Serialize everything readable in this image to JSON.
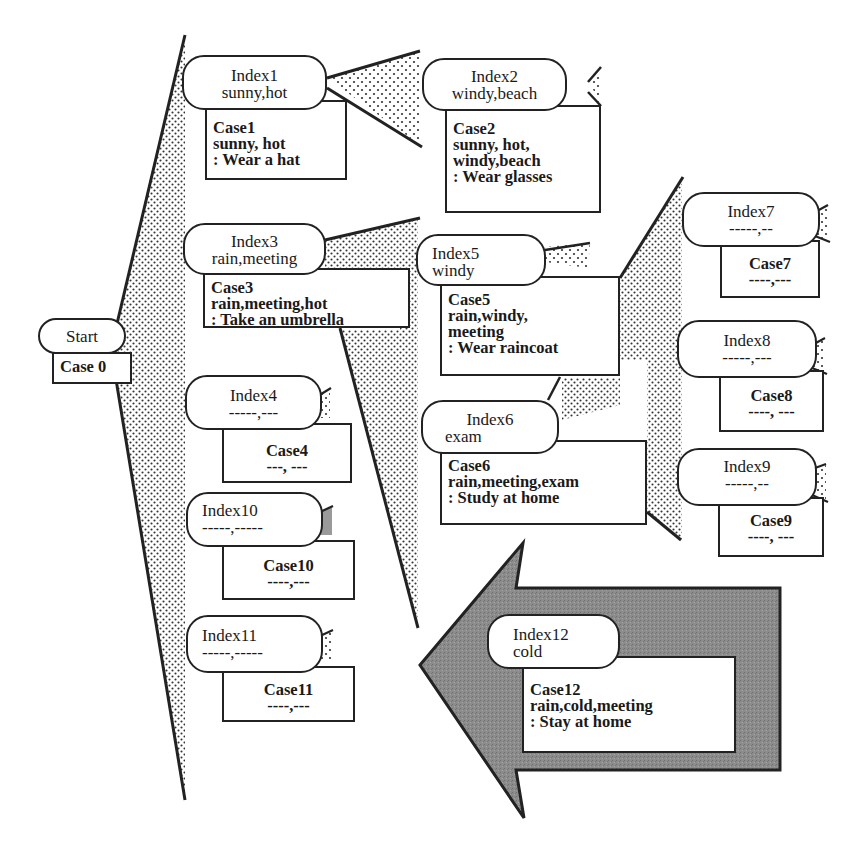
{
  "diagram": {
    "type": "case-base index tree",
    "colors": {
      "line": "#222222",
      "stipple": "#333333",
      "arrow_fill": "#8a8a8a",
      "background": "#ffffff"
    },
    "start": {
      "label": "Start",
      "case": "Case 0"
    },
    "nodes": [
      {
        "id": "index1",
        "index": "Index1",
        "keys": "sunny,hot",
        "case": "Case1",
        "features": [
          "sunny, hot"
        ],
        "action": ": Wear a hat"
      },
      {
        "id": "index2",
        "index": "Index2",
        "keys": "windy,beach",
        "case": "Case2",
        "features": [
          "sunny, hot,",
          "windy,beach"
        ],
        "action": ": Wear glasses"
      },
      {
        "id": "index3",
        "index": "Index3",
        "keys": "rain,meeting",
        "case": "Case3",
        "features": [
          "rain,meeting,hot"
        ],
        "action": ": Take an umbrella"
      },
      {
        "id": "index4",
        "index": "Index4",
        "keys": "-----,---",
        "case": "Case4",
        "features": [
          "---, ---"
        ],
        "action": ""
      },
      {
        "id": "index5",
        "index": "Index5",
        "keys": "windy",
        "case": "Case5",
        "features": [
          "rain,windy,",
          "meeting"
        ],
        "action": ": Wear raincoat"
      },
      {
        "id": "index6",
        "index": "Index6",
        "keys": "exam",
        "case": "Case6",
        "features": [
          "rain,meeting,exam"
        ],
        "action": ": Study at home"
      },
      {
        "id": "index7",
        "index": "Index7",
        "keys": "-----,--",
        "case": "Case7",
        "features": [
          "----,---"
        ],
        "action": ""
      },
      {
        "id": "index8",
        "index": "Index8",
        "keys": "-----,---",
        "case": "Case8",
        "features": [
          "----, ---"
        ],
        "action": ""
      },
      {
        "id": "index9",
        "index": "Index9",
        "keys": "-----,--",
        "case": "Case9",
        "features": [
          "----, ---"
        ],
        "action": ""
      },
      {
        "id": "index10",
        "index": "Index10",
        "keys": "-----,-----",
        "case": "Case10",
        "features": [
          "----,---"
        ],
        "action": ""
      },
      {
        "id": "index11",
        "index": "Index11",
        "keys": "-----,-----",
        "case": "Case11",
        "features": [
          "----,---"
        ],
        "action": ""
      },
      {
        "id": "index12",
        "index": "Index12",
        "keys": "cold",
        "case": "Case12",
        "features": [
          "rain,cold,meeting"
        ],
        "action": ": Stay at home"
      }
    ],
    "new_case_arrow": {
      "direction": "left",
      "target": "index3-subtree",
      "carries": "index12"
    }
  }
}
